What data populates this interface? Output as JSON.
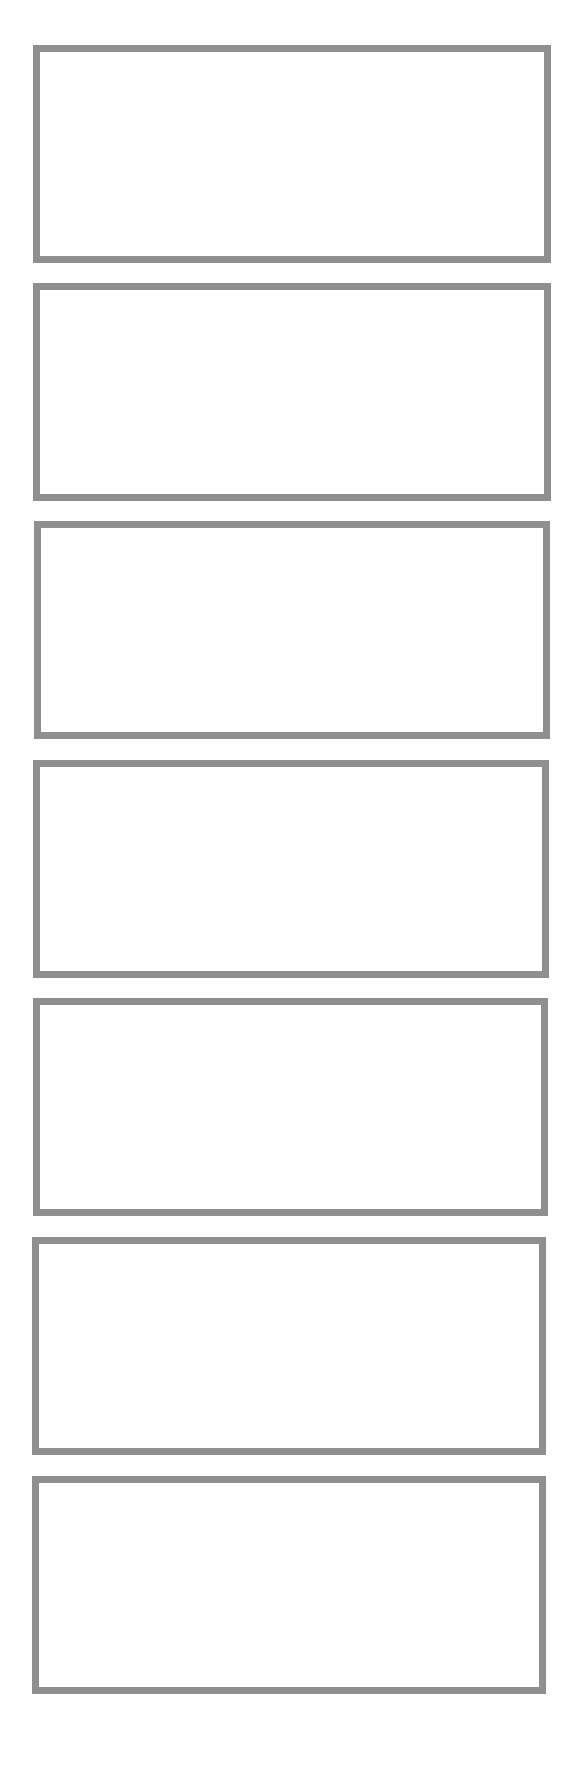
{
  "page": {
    "border_color": "#8f8f8f",
    "background": "#ffffff",
    "boxes": [
      {
        "index": 1,
        "content": "",
        "left": 33,
        "top": 45,
        "width": 518,
        "height": 218
      },
      {
        "index": 2,
        "content": "",
        "left": 33,
        "top": 283,
        "width": 518,
        "height": 218
      },
      {
        "index": 3,
        "content": "",
        "left": 34,
        "top": 521,
        "width": 516,
        "height": 218
      },
      {
        "index": 4,
        "content": "",
        "left": 33,
        "top": 760,
        "width": 516,
        "height": 218
      },
      {
        "index": 5,
        "content": "",
        "left": 33,
        "top": 998,
        "width": 515,
        "height": 218
      },
      {
        "index": 6,
        "content": "",
        "left": 32,
        "top": 1237,
        "width": 514,
        "height": 218
      },
      {
        "index": 7,
        "content": "",
        "left": 32,
        "top": 1476,
        "width": 514,
        "height": 218
      }
    ]
  }
}
